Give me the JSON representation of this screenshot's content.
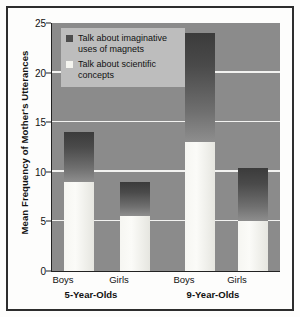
{
  "chart_data": {
    "type": "bar",
    "subtype": "stacked",
    "title": "",
    "xlabel": "",
    "ylabel": "Mean Frequency of Mother's Utterances",
    "ylim": [
      0,
      25
    ],
    "yticks": [
      0,
      5,
      10,
      15,
      20,
      25
    ],
    "ytick_labels": [
      "0",
      "5",
      "10",
      "15",
      "20",
      "25"
    ],
    "grid": true,
    "grid_axis": "y",
    "legend_position": "upper-left-inside",
    "categories": [
      "Boys",
      "Girls",
      "Boys",
      "Girls"
    ],
    "groups": [
      {
        "label": "5-Year-Olds",
        "categories": [
          "Boys",
          "Girls"
        ]
      },
      {
        "label": "9-Year-Olds",
        "categories": [
          "Boys",
          "Girls"
        ]
      }
    ],
    "series": [
      {
        "name": "Talk about scientific concepts",
        "color": "#f4f4ef",
        "values": [
          9.0,
          5.5,
          13.0,
          5.0
        ]
      },
      {
        "name": "Talk about imaginative uses of magnets",
        "color": "#4d4d4d",
        "values": [
          5.0,
          3.5,
          11.0,
          5.4
        ]
      }
    ],
    "bar_totals": [
      14.0,
      9.0,
      24.0,
      10.4
    ],
    "bars": [
      {
        "group": "5-Year-Olds",
        "category": "Boys",
        "total": 14.0,
        "scientific": 9.0,
        "imaginative": 5.0
      },
      {
        "group": "5-Year-Olds",
        "category": "Girls",
        "total": 9.0,
        "scientific": 5.5,
        "imaginative": 3.5
      },
      {
        "group": "9-Year-Olds",
        "category": "Boys",
        "total": 24.0,
        "scientific": 13.0,
        "imaginative": 11.0
      },
      {
        "group": "9-Year-Olds",
        "category": "Girls",
        "total": 10.4,
        "scientific": 5.0,
        "imaginative": 5.4
      }
    ]
  },
  "legend": {
    "entries": [
      {
        "label": "Talk about imaginative uses of magnets",
        "swatch": "dark"
      },
      {
        "label": "Talk about scientific concepts",
        "swatch": "light"
      }
    ]
  },
  "axis": {
    "y_title": "Mean Frequency of Mother's Utterances",
    "y_tick_labels": [
      "25",
      "20",
      "15",
      "10",
      "5",
      "0"
    ]
  },
  "x_axis": {
    "category_labels": [
      "Boys",
      "Girls",
      "Boys",
      "Girls"
    ],
    "group_labels": [
      "5-Year-Olds",
      "9-Year-Olds"
    ]
  },
  "colors": {
    "plot_background": "#8b8b8b",
    "gridline": "#f2f2f0",
    "series_dark": "#4d4d4d",
    "series_light": "#f4f4ef",
    "legend_background": "#bdbdbd",
    "frame": "#2d2d2d",
    "page_background": "#fdfdfc"
  }
}
